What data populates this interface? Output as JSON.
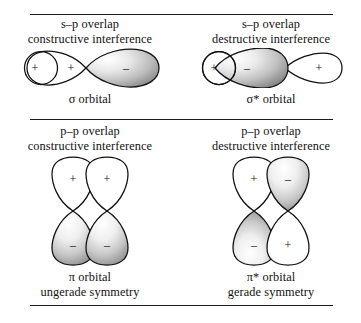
{
  "figure": {
    "panel_count": 4
  },
  "colors": {
    "ink": "#1a1a1a",
    "stroke": "#111111",
    "lobe_light": "#ffffff",
    "lobe_shade_light": "#f2f2f2",
    "lobe_shade_mid": "#b8b8b8",
    "lobe_shade_dark": "#6e6e6e"
  },
  "panels": {
    "sigma": {
      "caption_line1": "s–p overlap",
      "caption_line2": "constructive interference",
      "label_line1": "σ orbital",
      "label_line2": "",
      "lobes": [
        {
          "name": "s-orbital-circle",
          "sign": "+",
          "shaded": false
        },
        {
          "name": "p-lobe-near",
          "sign": "+",
          "shaded": false
        },
        {
          "name": "p-lobe-far",
          "sign": "–",
          "shaded": true
        }
      ]
    },
    "sigma_star": {
      "caption_line1": "s–p overlap",
      "caption_line2": "destructive interference",
      "label_line1": "σ* orbital",
      "label_line2": "",
      "lobes": [
        {
          "name": "s-orbital-circle",
          "sign": "+",
          "shaded": false
        },
        {
          "name": "p-lobe-near",
          "sign": "–",
          "shaded": true
        },
        {
          "name": "p-lobe-far",
          "sign": "+",
          "shaded": false
        }
      ]
    },
    "pi": {
      "caption_line1": "p–p overlap",
      "caption_line2": "constructive interference",
      "label_line1": "π orbital",
      "label_line2": "ungerade symmetry",
      "lobes": [
        {
          "name": "lobe-top-left",
          "sign": "+",
          "shaded": false
        },
        {
          "name": "lobe-top-right",
          "sign": "+",
          "shaded": false
        },
        {
          "name": "lobe-bottom-left",
          "sign": "–",
          "shaded": true
        },
        {
          "name": "lobe-bottom-right",
          "sign": "–",
          "shaded": true
        }
      ]
    },
    "pi_star": {
      "caption_line1": "p–p overlap",
      "caption_line2": "destructive interference",
      "label_line1": "π* orbital",
      "label_line2": "gerade symmetry",
      "lobes": [
        {
          "name": "lobe-top-left",
          "sign": "+",
          "shaded": false
        },
        {
          "name": "lobe-top-right",
          "sign": "–",
          "shaded": true
        },
        {
          "name": "lobe-bottom-left",
          "sign": "–",
          "shaded": true
        },
        {
          "name": "lobe-bottom-right",
          "sign": "+",
          "shaded": false
        }
      ]
    }
  }
}
